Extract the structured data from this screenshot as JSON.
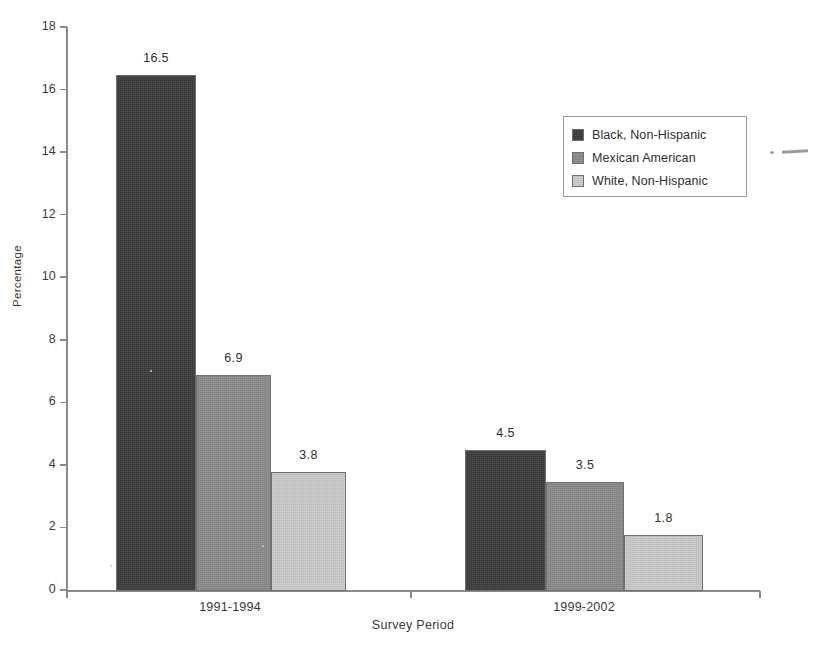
{
  "chart_data": {
    "type": "bar",
    "title": "",
    "xlabel": "Survey Period",
    "ylabel": "Percentage",
    "categories": [
      "1991-1994",
      "1999-2002"
    ],
    "series": [
      {
        "name": "Black, Non-Hispanic",
        "values": [
          16.5,
          4.5
        ],
        "color": "#3c3c3c"
      },
      {
        "name": "Mexican American",
        "values": [
          6.9,
          3.5
        ],
        "color": "#8b8b8b"
      },
      {
        "name": "White, Non-Hispanic",
        "values": [
          3.8,
          1.8
        ],
        "color": "#cbcbcb"
      }
    ],
    "ylim": [
      0,
      18
    ],
    "yticks": [
      0,
      2,
      4,
      6,
      8,
      10,
      12,
      14,
      16,
      18
    ],
    "ytick_labels": [
      "0",
      "2",
      "4",
      "6",
      "8",
      "10",
      "12",
      "14",
      "16",
      "18"
    ],
    "grid": false,
    "legend_position": "upper right",
    "data_labels": [
      "16.5",
      "6.9",
      "3.8",
      "4.5",
      "3.5",
      "1.8"
    ]
  },
  "axes": {
    "y_title": "Percentage",
    "x_title": "Survey Period",
    "y_ticks": [
      {
        "label": "18",
        "value": 18
      },
      {
        "label": "16",
        "value": 16
      },
      {
        "label": "14",
        "value": 14
      },
      {
        "label": "12",
        "value": 12
      },
      {
        "label": "10",
        "value": 10
      },
      {
        "label": "8",
        "value": 8
      },
      {
        "label": "6",
        "value": 6
      },
      {
        "label": "4",
        "value": 4
      },
      {
        "label": "2",
        "value": 2
      },
      {
        "label": "0",
        "value": 0
      }
    ],
    "x_categories": [
      "1991-1994",
      "1999-2002"
    ]
  },
  "legend": {
    "entries": [
      {
        "label": "Black, Non-Hispanic",
        "color": "#3c3c3c"
      },
      {
        "label": "Mexican American",
        "color": "#8b8b8b"
      },
      {
        "label": "White, Non-Hispanic",
        "color": "#cbcbcb"
      }
    ]
  },
  "bars": [
    {
      "value": 16.5,
      "label": "16.5",
      "series": "Black, Non-Hispanic",
      "category": "1991-1994"
    },
    {
      "value": 6.9,
      "label": "6.9",
      "series": "Mexican American",
      "category": "1991-1994"
    },
    {
      "value": 3.8,
      "label": "3.8",
      "series": "White, Non-Hispanic",
      "category": "1991-1994"
    },
    {
      "value": 4.5,
      "label": "4.5",
      "series": "Black, Non-Hispanic",
      "category": "1999-2002"
    },
    {
      "value": 3.5,
      "label": "3.5",
      "series": "Mexican American",
      "category": "1999-2002"
    },
    {
      "value": 1.8,
      "label": "1.8",
      "series": "White, Non-Hispanic",
      "category": "1999-2002"
    }
  ]
}
